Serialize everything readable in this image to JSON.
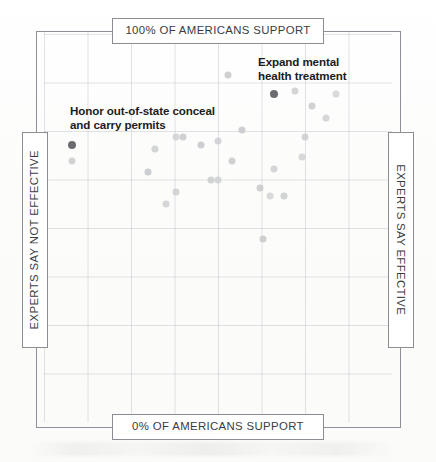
{
  "chart": {
    "type": "scatter",
    "title": "",
    "axis_boxes": {
      "top_label": "100% OF AMERICANS SUPPORT",
      "bottom_label": "0% OF AMERICANS SUPPORT",
      "left_label": "EXPERTS SAY NOT EFFECTIVE",
      "right_label": "EXPERTS SAY EFFECTIVE"
    },
    "annotations": [
      {
        "id": "expand-mental-health",
        "text": "Expand mental\nhealth treatment"
      },
      {
        "id": "honor-conceal-carry",
        "text": "Honor out-of-state conceal\nand carry permits"
      }
    ]
  },
  "chart_data": {
    "type": "scatter",
    "title": "",
    "xlabel": "Experts say not effective → Experts say effective",
    "ylabel": "0% of Americans support → 100% of Americans support",
    "xlim": [
      0,
      100
    ],
    "ylim": [
      0,
      100
    ],
    "grid": true,
    "legend": null,
    "axis_labels": {
      "x_min": "EXPERTS SAY NOT EFFECTIVE",
      "x_max": "EXPERTS SAY EFFECTIVE",
      "y_min": "0% OF AMERICANS SUPPORT",
      "y_max": "100% OF AMERICANS SUPPORT"
    },
    "annotations": [
      {
        "label": "Expand mental health treatment",
        "x": 66,
        "y": 84,
        "highlighted": true
      },
      {
        "label": "Honor out-of-state conceal and carry permits",
        "x": 8,
        "y": 71,
        "highlighted": true
      }
    ],
    "points": [
      {
        "x": 8,
        "y": 71,
        "highlighted": true,
        "label": "Honor out-of-state conceal and carry permits"
      },
      {
        "x": 8,
        "y": 67,
        "highlighted": false,
        "label": ""
      },
      {
        "x": 66,
        "y": 84,
        "highlighted": true,
        "label": "Expand mental health treatment"
      },
      {
        "x": 53,
        "y": 89,
        "highlighted": false,
        "label": ""
      },
      {
        "x": 72,
        "y": 85,
        "highlighted": false,
        "label": ""
      },
      {
        "x": 84,
        "y": 84,
        "highlighted": false,
        "label": ""
      },
      {
        "x": 77,
        "y": 81,
        "highlighted": false,
        "label": ""
      },
      {
        "x": 81,
        "y": 78,
        "highlighted": false,
        "label": ""
      },
      {
        "x": 57,
        "y": 75,
        "highlighted": false,
        "label": ""
      },
      {
        "x": 75,
        "y": 73,
        "highlighted": false,
        "label": ""
      },
      {
        "x": 38,
        "y": 73,
        "highlighted": false,
        "label": ""
      },
      {
        "x": 40,
        "y": 73,
        "highlighted": false,
        "label": ""
      },
      {
        "x": 50,
        "y": 72,
        "highlighted": false,
        "label": ""
      },
      {
        "x": 45,
        "y": 71,
        "highlighted": false,
        "label": ""
      },
      {
        "x": 32,
        "y": 70,
        "highlighted": false,
        "label": ""
      },
      {
        "x": 74,
        "y": 68,
        "highlighted": false,
        "label": ""
      },
      {
        "x": 54,
        "y": 67,
        "highlighted": false,
        "label": ""
      },
      {
        "x": 66,
        "y": 65,
        "highlighted": false,
        "label": ""
      },
      {
        "x": 30,
        "y": 64,
        "highlighted": false,
        "label": ""
      },
      {
        "x": 48,
        "y": 62,
        "highlighted": false,
        "label": ""
      },
      {
        "x": 50,
        "y": 62,
        "highlighted": false,
        "label": ""
      },
      {
        "x": 62,
        "y": 60,
        "highlighted": false,
        "label": ""
      },
      {
        "x": 38,
        "y": 59,
        "highlighted": false,
        "label": ""
      },
      {
        "x": 65,
        "y": 58,
        "highlighted": false,
        "label": ""
      },
      {
        "x": 69,
        "y": 58,
        "highlighted": false,
        "label": ""
      },
      {
        "x": 35,
        "y": 56,
        "highlighted": false,
        "label": ""
      },
      {
        "x": 63,
        "y": 47,
        "highlighted": false,
        "label": ""
      }
    ]
  }
}
